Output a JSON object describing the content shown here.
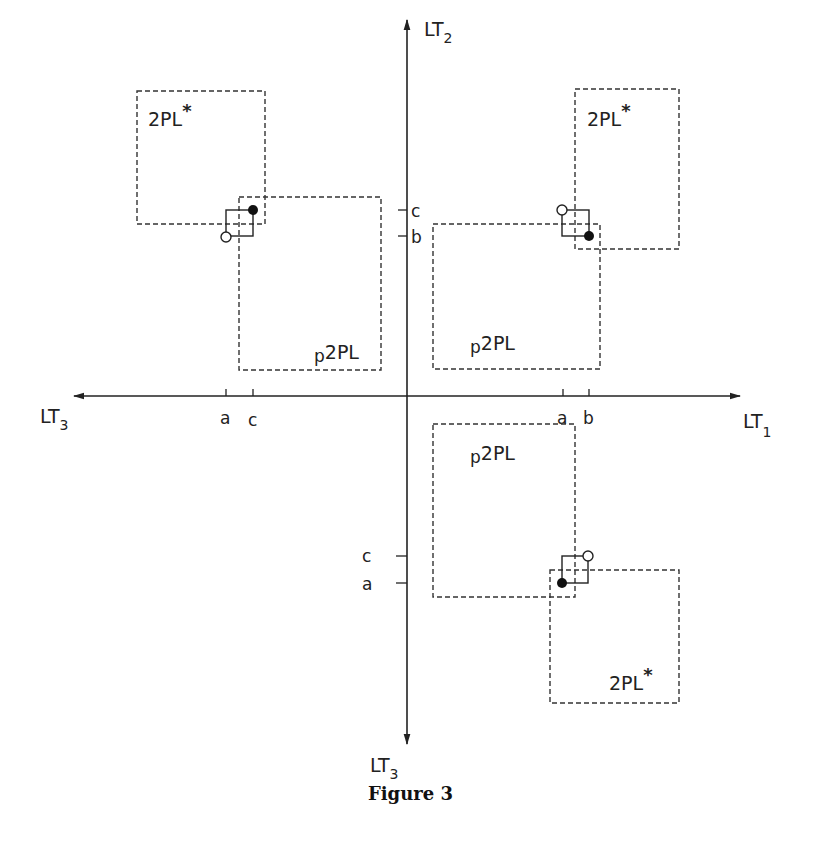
{
  "figure": {
    "caption": "Figure 3",
    "colors": {
      "ink": "#222222",
      "background": "#ffffff"
    }
  },
  "axes": {
    "vertical_top": {
      "label": "LT",
      "subscript": "2"
    },
    "horizontal_right": {
      "label": "LT",
      "subscript": "1"
    },
    "horizontal_left": {
      "label": "LT",
      "subscript": "3"
    },
    "vertical_bottom": {
      "label": "LT",
      "subscript": "3"
    }
  },
  "ticks": {
    "left_axis": [
      {
        "label": "a"
      },
      {
        "label": "c"
      }
    ],
    "right_axis": [
      {
        "label": "a"
      },
      {
        "label": "b"
      }
    ],
    "upper_axis": [
      {
        "label": "c"
      },
      {
        "label": "b"
      }
    ],
    "lower_axis": [
      {
        "label": "c"
      },
      {
        "label": "a"
      }
    ]
  },
  "quadrants": {
    "upper_left": {
      "upper_box": {
        "label": "2PL",
        "superscript": "*"
      },
      "lower_box": {
        "label": "2PL",
        "prefix": "p"
      }
    },
    "upper_right": {
      "upper_box": {
        "label": "2PL",
        "superscript": "*"
      },
      "lower_box": {
        "label": "2PL",
        "prefix": "p"
      }
    },
    "lower_right": {
      "upper_box": {
        "label": "2PL",
        "prefix": "p"
      },
      "lower_box": {
        "label": "2PL",
        "superscript": "*"
      }
    }
  },
  "markers": {
    "filled": "solid circle",
    "open": "hollow circle"
  }
}
